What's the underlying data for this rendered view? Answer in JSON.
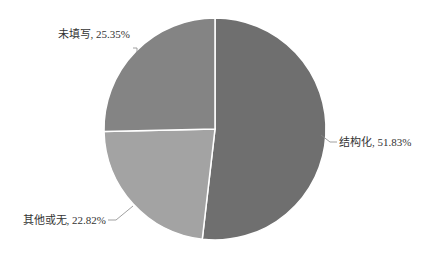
{
  "chart_data": {
    "type": "pie",
    "title": "",
    "categories": [
      "结构化",
      "其他或无",
      "未填写"
    ],
    "values": [
      51.83,
      22.82,
      25.35
    ],
    "unit": "%",
    "labels": [
      "结构化, 51.83%",
      "其他或无, 22.82%",
      "未填写, 25.35%"
    ],
    "colors": [
      "#6f6f6f",
      "#a3a3a3",
      "#848484"
    ],
    "start_angle_deg": 0,
    "direction": "clockwise",
    "legend": "none",
    "data_labels": "outside with leader lines"
  },
  "slices": [
    {
      "name": "结构化",
      "label": "结构化, 51.83%",
      "value": 51.83,
      "color": "#6f6f6f"
    },
    {
      "name": "其他或无",
      "label": "其他或无, 22.82%",
      "value": 22.82,
      "color": "#a3a3a3"
    },
    {
      "name": "未填写",
      "label": "未填写, 25.35%",
      "value": 25.35,
      "color": "#848484"
    }
  ]
}
